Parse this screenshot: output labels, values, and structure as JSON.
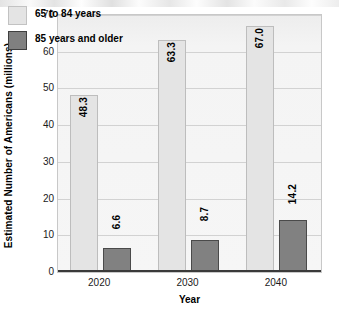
{
  "chart_data": {
    "type": "bar",
    "title": "",
    "xlabel": "Year",
    "ylabel": "Estimated Number of Americans (millions)",
    "categories": [
      "2020",
      "2030",
      "2040"
    ],
    "series": [
      {
        "name": "65 to 84 years",
        "values": [
          48.3,
          63.3,
          67.0
        ],
        "color": "#e4e4e4"
      },
      {
        "name": "85 years and older",
        "values": [
          6.6,
          8.7,
          14.2
        ],
        "color": "#808080"
      }
    ],
    "labels": [
      [
        "48.3",
        "63.3",
        "67.0"
      ],
      [
        "6.6",
        "8.7",
        "14.2"
      ]
    ],
    "ylim": [
      0,
      70
    ],
    "yticks": [
      "0",
      "10",
      "20",
      "30",
      "40",
      "50",
      "60",
      "70"
    ],
    "grid": true,
    "legend_position": "top-left"
  },
  "legend": {
    "items": [
      {
        "label": "65 to 84 years"
      },
      {
        "label": "85 years and older"
      }
    ]
  },
  "axes": {
    "x_title": "Year",
    "y_title": "Estimated Number of Americans (millions)"
  }
}
